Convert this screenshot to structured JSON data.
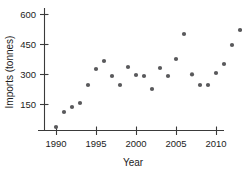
{
  "chart_data": {
    "type": "scatter",
    "title": "",
    "xlabel": "Year",
    "ylabel": "Imports (tonnes)",
    "xlim": [
      1989,
      2015.5
    ],
    "ylim": [
      0,
      660
    ],
    "grid": false,
    "legend": null,
    "xticks": [
      1990,
      1995,
      2000,
      2005,
      2010,
      2015
    ],
    "xticklabels": [
      "1990",
      "1995",
      "2000",
      "2005",
      "2010",
      ""
    ],
    "yticks": [
      150,
      300,
      450,
      600
    ],
    "yticklabels": [
      "150",
      "300",
      "450",
      "600"
    ],
    "marker": "circle",
    "marker_color": "#59595b",
    "x": [
      1990,
      1991,
      1992,
      1993,
      1994,
      1995,
      1996,
      1997,
      1998,
      1999,
      2000,
      2001,
      2002,
      2003,
      2004,
      2005,
      2006,
      2007,
      2008,
      2009,
      2010,
      2011,
      2012,
      2013,
      2014,
      2015
    ],
    "values": [
      35,
      110,
      135,
      155,
      245,
      325,
      365,
      290,
      245,
      335,
      295,
      290,
      225,
      330,
      290,
      375,
      500,
      298,
      245,
      245,
      305,
      350,
      445,
      520,
      645,
      520
    ],
    "points": [
      {
        "year": 1990,
        "imports": 35
      },
      {
        "year": 1991,
        "imports": 110
      },
      {
        "year": 1992,
        "imports": 135
      },
      {
        "year": 1993,
        "imports": 155
      },
      {
        "year": 1994,
        "imports": 245
      },
      {
        "year": 1995,
        "imports": 325
      },
      {
        "year": 1996,
        "imports": 365
      },
      {
        "year": 1997,
        "imports": 290
      },
      {
        "year": 1998,
        "imports": 245
      },
      {
        "year": 1999,
        "imports": 335
      },
      {
        "year": 2000,
        "imports": 295
      },
      {
        "year": 2001,
        "imports": 290
      },
      {
        "year": 2002,
        "imports": 225
      },
      {
        "year": 2003,
        "imports": 330
      },
      {
        "year": 2004,
        "imports": 290
      },
      {
        "year": 2005,
        "imports": 375
      },
      {
        "year": 2006,
        "imports": 500
      },
      {
        "year": 2007,
        "imports": 298
      },
      {
        "year": 2008,
        "imports": 245
      },
      {
        "year": 2009,
        "imports": 245
      },
      {
        "year": 2010,
        "imports": 305
      },
      {
        "year": 2011,
        "imports": 350
      },
      {
        "year": 2012,
        "imports": 445
      },
      {
        "year": 2013,
        "imports": 520
      },
      {
        "year": 2014,
        "imports": 645
      },
      {
        "year": 2015,
        "imports": 520
      }
    ]
  },
  "colors": {
    "marker": "#59595b",
    "axis": "#3a3a3a",
    "text": "#1c1c1c",
    "background": "#ffffff"
  }
}
